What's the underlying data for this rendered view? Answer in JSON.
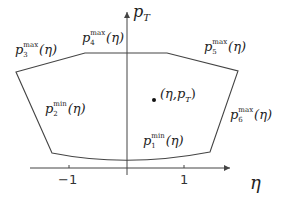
{
  "diagram": {
    "axes": {
      "y_label_base": "p",
      "y_label_sub": "T",
      "x_label": "η",
      "ticks": [
        {
          "label": "−1",
          "value": -1
        },
        {
          "label": "1",
          "value": 1
        }
      ]
    },
    "boundaries": [
      {
        "id": "p1",
        "base": "p",
        "sub": "1",
        "sup": "min",
        "arg": "(η)"
      },
      {
        "id": "p2",
        "base": "p",
        "sub": "2",
        "sup": "min",
        "arg": "(η)"
      },
      {
        "id": "p3",
        "base": "p",
        "sub": "3",
        "sup": "max",
        "arg": "(η)"
      },
      {
        "id": "p4",
        "base": "p",
        "sub": "4",
        "sup": "max",
        "arg": "(η)"
      },
      {
        "id": "p5",
        "base": "p",
        "sub": "5",
        "sup": "max",
        "arg": "(η)"
      },
      {
        "id": "p6",
        "base": "p",
        "sub": "6",
        "sup": "max",
        "arg": "(η)"
      }
    ],
    "point": {
      "open": "(η,",
      "base": "p",
      "sub": "T",
      "close": ")"
    },
    "colors": {
      "line": "#444444",
      "text": "#222222"
    }
  }
}
